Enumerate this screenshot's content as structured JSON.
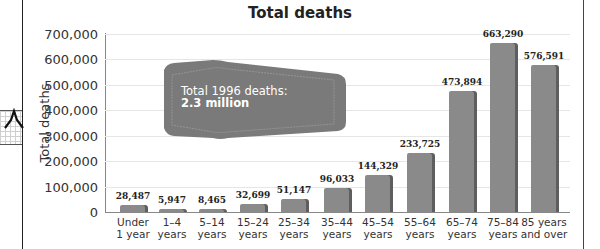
{
  "chart_data": {
    "type": "bar",
    "title": "Total deaths",
    "xlabel": "",
    "ylabel": "Total deaths",
    "ylim": [
      0,
      700000
    ],
    "yticks": [
      0,
      100000,
      200000,
      300000,
      400000,
      500000,
      600000,
      700000
    ],
    "ytick_labels": [
      "0",
      "100,000",
      "200,000",
      "300,000",
      "400,000",
      "500,000",
      "600,000",
      "700,000"
    ],
    "grid": true,
    "categories": [
      "Under 1 year",
      "1–4 years",
      "5–14 years",
      "15–24 years",
      "25–34 years",
      "35–44 years",
      "45–54 years",
      "55–64 years",
      "65–74 years",
      "75–84 years",
      "85 years and over"
    ],
    "category_lines": [
      [
        "Under",
        "1 year"
      ],
      [
        "1–4",
        "years"
      ],
      [
        "5–14",
        "years"
      ],
      [
        "15–24",
        "years"
      ],
      [
        "25–34",
        "years"
      ],
      [
        "35–44",
        "years"
      ],
      [
        "45–54",
        "years"
      ],
      [
        "55–64",
        "years"
      ],
      [
        "65–74",
        "years"
      ],
      [
        "75–84",
        "years"
      ],
      [
        "85 years",
        "and over"
      ]
    ],
    "values": [
      28487,
      5947,
      8465,
      32699,
      51147,
      96033,
      144329,
      233725,
      473894,
      663290,
      576591
    ],
    "value_labels": [
      "28,487",
      "5,947",
      "8,465",
      "32,699",
      "51,147",
      "96,033",
      "144,329",
      "233,725",
      "473,894",
      "663,290",
      "576,591"
    ],
    "annotations": [
      {
        "line1": "Total 1996 deaths:",
        "line2": "2.3 million"
      }
    ],
    "colors": {
      "bar": "#8a8a8a",
      "bar_shadow": "#5e5e5e",
      "callout": "#7a7a7a",
      "grid": "#e6e6e6"
    }
  },
  "header": {
    "title": "Total deaths"
  },
  "axis": {
    "ylabel": "Total deaths"
  },
  "callout": {
    "line1": "Total 1996 deaths:",
    "line2": "2.3 million"
  }
}
